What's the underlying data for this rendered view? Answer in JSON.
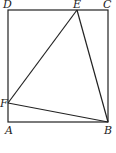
{
  "diagram": {
    "type": "geometry",
    "points": {
      "A": {
        "label": "A",
        "x": 8,
        "y": 122
      },
      "B": {
        "label": "B",
        "x": 108,
        "y": 122
      },
      "C": {
        "label": "C",
        "x": 108,
        "y": 10
      },
      "D": {
        "label": "D",
        "x": 8,
        "y": 10
      },
      "E": {
        "label": "E",
        "x": 77,
        "y": 10
      },
      "F": {
        "label": "F",
        "x": 8,
        "y": 103
      }
    },
    "segments": [
      "AB",
      "BC",
      "CD",
      "DA",
      "EF",
      "EB",
      "FB"
    ],
    "stroke_color": "#222222"
  }
}
